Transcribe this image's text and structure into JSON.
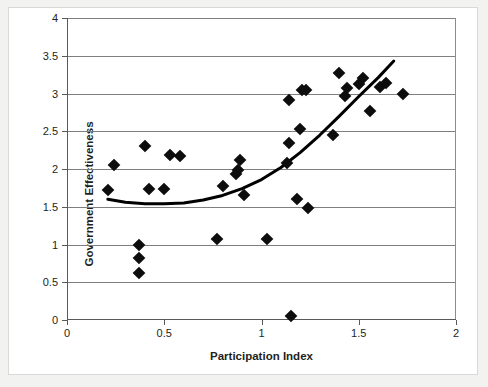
{
  "chart_data": {
    "type": "scatter",
    "title": "",
    "xlabel": "Participation Index",
    "ylabel": "Government Effectiveness",
    "xlim": [
      0,
      2
    ],
    "ylim": [
      0,
      4
    ],
    "xticks": [
      "0",
      "0.5",
      "1",
      "1.5",
      "2"
    ],
    "xtick_values": [
      0,
      0.5,
      1,
      1.5,
      2
    ],
    "yticks": [
      "0",
      "0.5",
      "1",
      "1.5",
      "2",
      "2.5",
      "3",
      "3.5",
      "4"
    ],
    "ytick_values": [
      0,
      0.5,
      1,
      1.5,
      2,
      2.5,
      3,
      3.5,
      4
    ],
    "grid": "horizontal",
    "legend": "none",
    "marker": "diamond",
    "marker_color": "#0d0d0d",
    "points": [
      {
        "x": 0.21,
        "y": 1.72
      },
      {
        "x": 0.24,
        "y": 2.05
      },
      {
        "x": 0.37,
        "y": 1.0
      },
      {
        "x": 0.37,
        "y": 0.82
      },
      {
        "x": 0.37,
        "y": 0.62
      },
      {
        "x": 0.4,
        "y": 2.3
      },
      {
        "x": 0.42,
        "y": 1.74
      },
      {
        "x": 0.5,
        "y": 1.73
      },
      {
        "x": 0.53,
        "y": 2.19
      },
      {
        "x": 0.58,
        "y": 2.17
      },
      {
        "x": 0.77,
        "y": 1.07
      },
      {
        "x": 0.8,
        "y": 1.77
      },
      {
        "x": 0.87,
        "y": 1.93
      },
      {
        "x": 0.88,
        "y": 1.99
      },
      {
        "x": 0.89,
        "y": 2.12
      },
      {
        "x": 0.91,
        "y": 1.65
      },
      {
        "x": 1.03,
        "y": 1.07
      },
      {
        "x": 1.13,
        "y": 2.08
      },
      {
        "x": 1.14,
        "y": 2.35
      },
      {
        "x": 1.14,
        "y": 2.92
      },
      {
        "x": 1.15,
        "y": 0.05
      },
      {
        "x": 1.18,
        "y": 1.6
      },
      {
        "x": 1.2,
        "y": 2.53
      },
      {
        "x": 1.21,
        "y": 3.05
      },
      {
        "x": 1.23,
        "y": 3.05
      },
      {
        "x": 1.24,
        "y": 1.49
      },
      {
        "x": 1.37,
        "y": 2.45
      },
      {
        "x": 1.4,
        "y": 3.27
      },
      {
        "x": 1.43,
        "y": 2.97
      },
      {
        "x": 1.44,
        "y": 3.07
      },
      {
        "x": 1.5,
        "y": 3.13
      },
      {
        "x": 1.52,
        "y": 3.21
      },
      {
        "x": 1.56,
        "y": 2.77
      },
      {
        "x": 1.61,
        "y": 3.08
      },
      {
        "x": 1.64,
        "y": 3.14
      },
      {
        "x": 1.73,
        "y": 3.0
      }
    ],
    "trend_line": {
      "style": "solid",
      "color": "#000000",
      "width": 3,
      "points": [
        {
          "x": 0.21,
          "y": 1.6
        },
        {
          "x": 0.3,
          "y": 1.56
        },
        {
          "x": 0.4,
          "y": 1.54
        },
        {
          "x": 0.5,
          "y": 1.54
        },
        {
          "x": 0.6,
          "y": 1.55
        },
        {
          "x": 0.7,
          "y": 1.59
        },
        {
          "x": 0.8,
          "y": 1.65
        },
        {
          "x": 0.9,
          "y": 1.74
        },
        {
          "x": 1.0,
          "y": 1.86
        },
        {
          "x": 1.1,
          "y": 2.02
        },
        {
          "x": 1.2,
          "y": 2.22
        },
        {
          "x": 1.3,
          "y": 2.45
        },
        {
          "x": 1.4,
          "y": 2.7
        },
        {
          "x": 1.5,
          "y": 2.96
        },
        {
          "x": 1.6,
          "y": 3.21
        },
        {
          "x": 1.68,
          "y": 3.43
        }
      ]
    }
  }
}
